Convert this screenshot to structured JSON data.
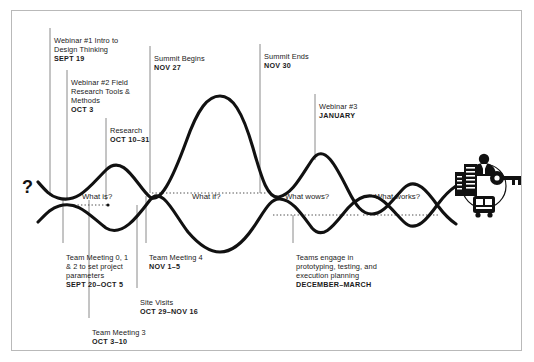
{
  "diagram": {
    "title_glyph": "?",
    "phases": [
      {
        "id": "what-is",
        "label": "What is?"
      },
      {
        "id": "what-if",
        "label": "What if?"
      },
      {
        "id": "what-wows",
        "label": "What wows?"
      },
      {
        "id": "what-works",
        "label": "What works?"
      }
    ],
    "top_labels": [
      {
        "id": "webinar-1",
        "text": "Webinar #1 Intro to\nDesign Thinking",
        "date": "SEPT 19"
      },
      {
        "id": "webinar-2",
        "text": "Webinar #2 Field\nResearch Tools &\nMethods",
        "date": "OCT 3"
      },
      {
        "id": "research",
        "text": "Research",
        "date": "OCT 10–31"
      },
      {
        "id": "summit-begins",
        "text": "Summit Begins",
        "date": "NOV 27"
      },
      {
        "id": "summit-ends",
        "text": "Summit Ends",
        "date": "NOV 30"
      },
      {
        "id": "webinar-3",
        "text": "Webinar #3",
        "date": "JANUARY"
      }
    ],
    "bottom_labels": [
      {
        "id": "team-meeting-012",
        "text": "Team Meeting 0, 1\n& 2 to set project\nparameters",
        "date": "SEPT 20–OCT 5"
      },
      {
        "id": "team-meeting-4",
        "text": "Team Meeting 4",
        "date": "NOV 1–5"
      },
      {
        "id": "site-visits",
        "text": "Site Visits",
        "date": "OCT 29–NOV 16"
      },
      {
        "id": "team-meeting-3",
        "text": "Team Meeting 3",
        "date": "OCT 3–10"
      },
      {
        "id": "teams-engage",
        "text": "Teams engage in\nprototyping, testing, and\nexecution planning",
        "date": "DECEMBER–MARCH"
      }
    ],
    "icons": [
      {
        "id": "person-icon",
        "name": "person-icon"
      },
      {
        "id": "building-icon",
        "name": "building-icon"
      },
      {
        "id": "key-icon",
        "name": "key-icon"
      },
      {
        "id": "bus-icon",
        "name": "bus-icon"
      }
    ],
    "colors": {
      "stroke": "#111111",
      "frame": "#b9b9b9",
      "leader": "#8a8a8a",
      "dotted": "#4d4d4d",
      "background": "#ffffff"
    }
  }
}
